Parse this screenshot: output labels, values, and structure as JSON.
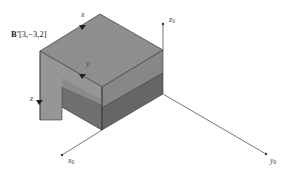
{
  "figure": {
    "point_label": {
      "name": "B'",
      "coords": "[3,−3,2]"
    },
    "local_axes": {
      "x": "x",
      "y": "y",
      "z": "z"
    },
    "global_axes": {
      "x": {
        "base": "x",
        "sub": "0"
      },
      "y": {
        "base": "y",
        "sub": "0"
      },
      "z": {
        "base": "z",
        "sub": "0"
      }
    },
    "colors": {
      "top_face": "#8e8e8e",
      "left_face": "#969696",
      "notch_face": "#6f6f6f",
      "right_upper": "#878787",
      "right_lower": "#666666",
      "edge": "#3a3a3a",
      "axis": "#555555"
    }
  }
}
